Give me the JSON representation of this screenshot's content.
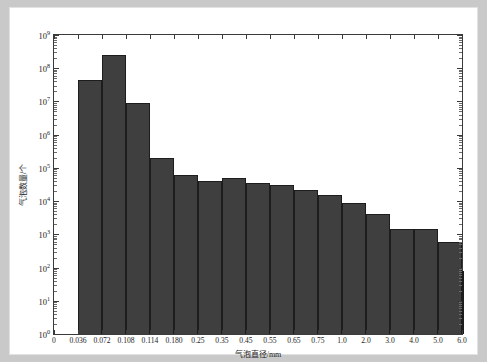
{
  "figure": {
    "background_color": "#ffffff",
    "bar_color": "#3f3f3f",
    "axis_color": "#3a3a3a"
  },
  "chart_data": {
    "type": "bar",
    "title": "",
    "xlabel": "气泡直径/mm",
    "ylabel": "气泡数量/个",
    "yscale": "log",
    "ylim": [
      1,
      1000000000
    ],
    "ytick_labels": [
      "10⁰",
      "10¹",
      "10²",
      "10³",
      "10⁴",
      "10⁵",
      "10⁶",
      "10⁷",
      "10⁸",
      "10⁹"
    ],
    "ytick_values": [
      1,
      10,
      100,
      1000,
      10000,
      100000,
      1000000,
      10000000,
      100000000,
      1000000000
    ],
    "xtick_labels": [
      "0",
      "0.036",
      "0.072",
      "0.108",
      "0.114",
      "0.180",
      "0.25",
      "0.35",
      "0.45",
      "0.55",
      "0.65",
      "0.75",
      "1.0",
      "2.0",
      "3.0",
      "4.0",
      "5.0",
      "6.0"
    ],
    "grid": false,
    "legend": "none",
    "bin_edges": [
      "0.036",
      "0.072",
      "0.108",
      "0.114",
      "0.180",
      "0.25",
      "0.35",
      "0.45",
      "0.55",
      "0.65",
      "0.75",
      "1.0",
      "2.0",
      "3.0",
      "4.0",
      "5.0",
      "6.0"
    ],
    "categories": [
      "0.036-0.072",
      "0.072-0.108",
      "0.108-0.114",
      "0.114-0.180",
      "0.180-0.25",
      "0.25-0.35",
      "0.35-0.45",
      "0.45-0.55",
      "0.55-0.65",
      "0.65-0.75",
      "0.75-1.0",
      "1.0-2.0",
      "2.0-3.0",
      "3.0-4.0",
      "4.0-5.0",
      "5.0-6.0",
      "6.0-6.4"
    ],
    "values": [
      44000000,
      250000000,
      8800000,
      200000,
      62000,
      41000,
      50000,
      36000,
      31000,
      22000,
      15000,
      8500,
      4200,
      1400,
      1400,
      600,
      80
    ]
  }
}
